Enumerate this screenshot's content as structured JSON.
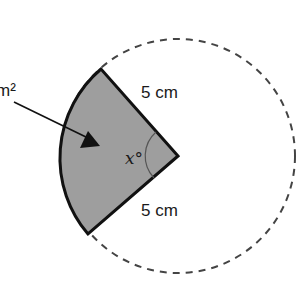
{
  "diagram": {
    "type": "circle-sector",
    "circle": {
      "style": "dashed",
      "color": "#444444"
    },
    "sector": {
      "fill": "#9e9e9e",
      "outline": "#111111"
    },
    "labels": {
      "radius_top": "5 cm",
      "radius_bottom": "5 cm",
      "angle": "x°",
      "area_label_partial": "m²"
    },
    "arrow": {
      "points_to": "sector",
      "color": "#111111"
    }
  }
}
